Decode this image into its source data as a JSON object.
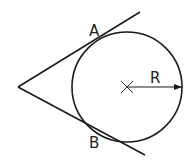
{
  "diagram": {
    "stroke_color": "#1a1a1a",
    "vertex": {
      "x": 18,
      "y": 87
    },
    "circle": {
      "cx": 127,
      "cy": 87,
      "r": 55
    },
    "upper_line": {
      "x1": 18,
      "y1": 87,
      "x2": 140,
      "y2": 12
    },
    "lower_line": {
      "x1": 18,
      "y1": 87,
      "x2": 145,
      "y2": 155
    },
    "labels": {
      "tangent_point_a": "A",
      "tangent_point_b": "B",
      "radius": "R"
    },
    "label_positions": {
      "a": {
        "x": 89,
        "y": 36
      },
      "b": {
        "x": 89,
        "y": 148
      },
      "r": {
        "x": 150,
        "y": 83
      }
    }
  }
}
